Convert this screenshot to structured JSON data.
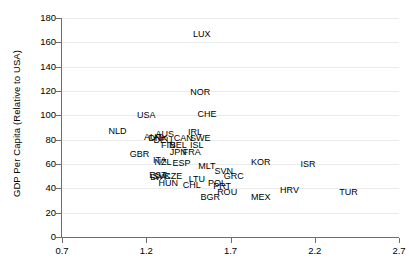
{
  "chart_data": {
    "type": "scatter",
    "title": "",
    "xlabel": "",
    "ylabel": "GDP Per Capita (Relative to USA)",
    "xlim": [
      0.7,
      2.7
    ],
    "ylim": [
      0,
      180
    ],
    "xticks": [
      "0.7",
      "1.2",
      "1.7",
      "2.2",
      "2.7"
    ],
    "xtick_values": [
      0.7,
      1.2,
      1.7,
      2.2,
      2.7
    ],
    "yticks": [
      "0",
      "20",
      "40",
      "60",
      "80",
      "100",
      "120",
      "140",
      "160",
      "180"
    ],
    "ytick_values": [
      0,
      20,
      40,
      60,
      80,
      100,
      120,
      140,
      160,
      180
    ],
    "grid": true,
    "legend": "none",
    "marker_style": "text-labels-only",
    "points": [
      {
        "label": "LUX",
        "x": 1.53,
        "y": 167
      },
      {
        "label": "NOR",
        "x": 1.52,
        "y": 119
      },
      {
        "label": "CHE",
        "x": 1.56,
        "y": 101
      },
      {
        "label": "USA",
        "x": 1.2,
        "y": 100
      },
      {
        "label": "NLD",
        "x": 1.03,
        "y": 87
      },
      {
        "label": "IRL",
        "x": 1.49,
        "y": 86
      },
      {
        "label": "AUS",
        "x": 1.31,
        "y": 85
      },
      {
        "label": "AUT",
        "x": 1.24,
        "y": 82
      },
      {
        "label": "DNK",
        "x": 1.27,
        "y": 81
      },
      {
        "label": "DEU",
        "x": 1.3,
        "y": 80
      },
      {
        "label": "CAN",
        "x": 1.42,
        "y": 81
      },
      {
        "label": "SWE",
        "x": 1.52,
        "y": 81
      },
      {
        "label": "FIN",
        "x": 1.33,
        "y": 76
      },
      {
        "label": "BEL",
        "x": 1.39,
        "y": 76
      },
      {
        "label": "ISL",
        "x": 1.5,
        "y": 76
      },
      {
        "label": "JPN",
        "x": 1.39,
        "y": 70
      },
      {
        "label": "FRA",
        "x": 1.47,
        "y": 70
      },
      {
        "label": "GBR",
        "x": 1.16,
        "y": 68
      },
      {
        "label": "ITA",
        "x": 1.28,
        "y": 63
      },
      {
        "label": "NZL",
        "x": 1.3,
        "y": 62
      },
      {
        "label": "ESP",
        "x": 1.41,
        "y": 61
      },
      {
        "label": "MLT",
        "x": 1.56,
        "y": 58
      },
      {
        "label": "KOR",
        "x": 1.88,
        "y": 62
      },
      {
        "label": "ISR",
        "x": 2.16,
        "y": 60
      },
      {
        "label": "SVN",
        "x": 1.66,
        "y": 54
      },
      {
        "label": "EST",
        "x": 1.27,
        "y": 51
      },
      {
        "label": "SVK",
        "x": 1.29,
        "y": 50
      },
      {
        "label": "LVA",
        "x": 1.27,
        "y": 49
      },
      {
        "label": "CZE",
        "x": 1.36,
        "y": 50
      },
      {
        "label": "GRC",
        "x": 1.72,
        "y": 50
      },
      {
        "label": "LTU",
        "x": 1.5,
        "y": 48
      },
      {
        "label": "HUN",
        "x": 1.33,
        "y": 44
      },
      {
        "label": "CHL",
        "x": 1.47,
        "y": 43
      },
      {
        "label": "POL",
        "x": 1.62,
        "y": 44
      },
      {
        "label": "PRT",
        "x": 1.65,
        "y": 42
      },
      {
        "label": "ROU",
        "x": 1.68,
        "y": 37
      },
      {
        "label": "BGR",
        "x": 1.58,
        "y": 33
      },
      {
        "label": "MEX",
        "x": 1.88,
        "y": 33
      },
      {
        "label": "HRV",
        "x": 2.05,
        "y": 39
      },
      {
        "label": "TUR",
        "x": 2.4,
        "y": 37
      }
    ]
  },
  "colors": {
    "grid": "#ebebeb",
    "axis": "#6e6e6e",
    "text": "#000000",
    "background": "#ffffff"
  }
}
